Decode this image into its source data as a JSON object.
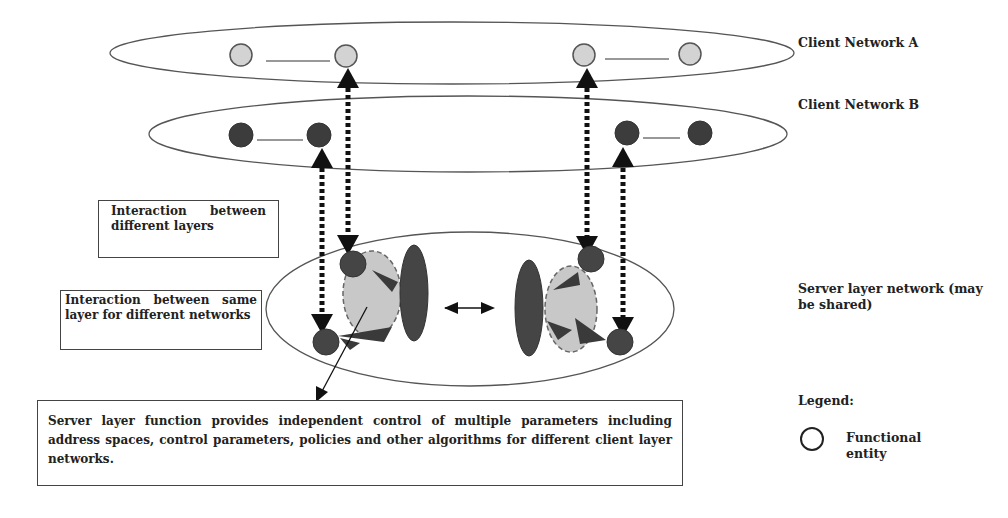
{
  "diagram": {
    "labels": {
      "client_a": "Client Network A",
      "client_b": "Client Network B",
      "server_layer": "Server layer network (may be shared)",
      "legend_title": "Legend:",
      "legend_functional_entity": "Functional entity"
    },
    "callouts": {
      "interaction_different_layers": "Interaction between different layers",
      "interaction_same_layer": "Interaction between same layer for different networks",
      "server_function": "Server layer function provides independent control of multiple parameters including address spaces, control parameters, policies and other algorithms for different client layer networks."
    },
    "colors": {
      "client_a_node": "#d3d3d3",
      "client_b_node": "#3c3c3c",
      "server_node": "#454545",
      "control_area": "#c8c8c8",
      "outline": "#444444"
    }
  }
}
